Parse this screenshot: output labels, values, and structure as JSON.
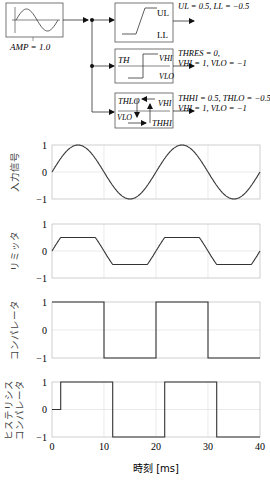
{
  "diagram": {
    "source": {
      "name": "sine-source",
      "param_label": "AMP = 1.0"
    },
    "blocks": [
      {
        "name": "limiter",
        "labels": [
          "UL",
          "LL"
        ],
        "params": [
          "UL = 0.5, LL = −0.5"
        ]
      },
      {
        "name": "comparator",
        "labels": [
          "TH",
          "VHI",
          "VLO"
        ],
        "params": [
          "THRES = 0,",
          "VHI = 1, VLO = −1"
        ]
      },
      {
        "name": "hysteresis-comparator",
        "labels": [
          "THLO",
          "VHI",
          "VLO",
          "THHI"
        ],
        "params": [
          "THHI = 0.5, THLO = −0.5",
          "VHI = 1, VLO = −1"
        ]
      }
    ]
  },
  "chart_data": [
    {
      "type": "line",
      "ylabel": "入力信号",
      "xlim": [
        0,
        40
      ],
      "ylim": [
        -1,
        1
      ],
      "yticks": [
        1,
        0,
        -1
      ],
      "ytick_labels": [
        "1",
        "0",
        "−1"
      ],
      "grid": true,
      "series": [
        {
          "name": "input",
          "function": "sin(2*pi*t/20)",
          "amplitude": 1.0,
          "period_ms": 20
        }
      ]
    },
    {
      "type": "line",
      "ylabel": "リミッタ",
      "xlim": [
        0,
        40
      ],
      "ylim": [
        -1,
        1
      ],
      "yticks": [
        1,
        0,
        -1
      ],
      "ytick_labels": [
        "1",
        "0",
        "−1"
      ],
      "grid": true,
      "series": [
        {
          "name": "limiter",
          "function": "clip(sin(2*pi*t/20), -0.5, 0.5)"
        }
      ]
    },
    {
      "type": "line",
      "ylabel": "コンパレータ",
      "xlim": [
        0,
        40
      ],
      "ylim": [
        -1,
        1
      ],
      "yticks": [
        1,
        0,
        -1
      ],
      "ytick_labels": [
        "1",
        "0",
        "−1"
      ],
      "grid": true,
      "series": [
        {
          "name": "comparator",
          "x": [
            0,
            10,
            10,
            20,
            20,
            30,
            30,
            40
          ],
          "y": [
            1,
            1,
            -1,
            -1,
            1,
            1,
            -1,
            -1
          ]
        }
      ]
    },
    {
      "type": "line",
      "ylabel": "ヒステリシス\nコンパレータ",
      "xlim": [
        0,
        40
      ],
      "ylim": [
        -1,
        1
      ],
      "yticks": [
        1,
        0,
        -1
      ],
      "ytick_labels": [
        "1",
        "0",
        "−1"
      ],
      "xticks": [
        0,
        10,
        20,
        30,
        40
      ],
      "xtick_labels": [
        "0",
        "10",
        "20",
        "30",
        "40"
      ],
      "xlabel": "時刻 [ms]",
      "grid": true,
      "series": [
        {
          "name": "hysteresis",
          "x": [
            0,
            1.67,
            1.67,
            11.67,
            11.67,
            21.67,
            21.67,
            31.67,
            31.67,
            40
          ],
          "y": [
            0,
            0,
            1,
            1,
            -1,
            -1,
            1,
            1,
            -1,
            -1
          ]
        }
      ]
    }
  ]
}
